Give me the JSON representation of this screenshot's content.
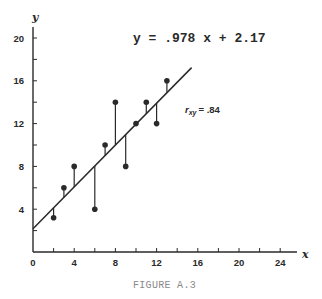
{
  "figure": {
    "caption": "FIGURE A.3",
    "equation": "y = .978 x + 2.17",
    "r_label": {
      "symbol": "r",
      "subscript": "xy",
      "value": "= .84"
    }
  },
  "chart_data": {
    "type": "scatter",
    "title": "",
    "xlabel": "x",
    "ylabel": "y",
    "xlim": [
      0,
      26
    ],
    "ylim": [
      0,
      21
    ],
    "x_ticks": [
      0,
      4,
      8,
      12,
      16,
      20,
      24
    ],
    "y_ticks": [
      4,
      8,
      12,
      16,
      20
    ],
    "minor_tick_step": 2,
    "grid": false,
    "legend": null,
    "series": [
      {
        "name": "observations",
        "points": [
          {
            "x": 2,
            "y": 3.2
          },
          {
            "x": 3,
            "y": 6
          },
          {
            "x": 4,
            "y": 8
          },
          {
            "x": 6,
            "y": 4
          },
          {
            "x": 7,
            "y": 10
          },
          {
            "x": 8,
            "y": 14
          },
          {
            "x": 9,
            "y": 8
          },
          {
            "x": 10,
            "y": 12
          },
          {
            "x": 11,
            "y": 14
          },
          {
            "x": 12,
            "y": 12
          },
          {
            "x": 13,
            "y": 16
          }
        ],
        "residual_lines": true
      }
    ],
    "regression_line": {
      "slope": 0.978,
      "intercept": 2.17,
      "x_range": [
        0,
        15.4
      ]
    },
    "annotations": [
      {
        "text": "y = .978 x + 2.17",
        "position": "top-center"
      },
      {
        "text": "r_xy = .84",
        "position": "right of line near y=13"
      }
    ]
  },
  "layout": {
    "origin_px": [
      33,
      252
    ],
    "x_px_per_unit": 10.3,
    "y_px_per_unit": 10.7,
    "x_axis_end_px": 297,
    "y_axis_top_px": 27,
    "ink_color": "#2a2a2a"
  }
}
